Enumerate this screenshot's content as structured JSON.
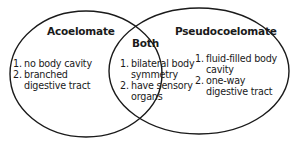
{
  "diagram": {
    "type": "venn",
    "left": {
      "title": "Acoelomate",
      "items": [
        {
          "num": "1.",
          "lines": [
            "no body cavity"
          ]
        },
        {
          "num": "2.",
          "lines": [
            "branched",
            "digestive tract"
          ]
        }
      ]
    },
    "center": {
      "title": "Both",
      "items": [
        {
          "num": "1.",
          "lines": [
            "bilateral body",
            "symmetry"
          ]
        },
        {
          "num": "2.",
          "lines": [
            "have sensory",
            "organs"
          ]
        }
      ]
    },
    "right": {
      "title": "Pseudocoelomate",
      "items": [
        {
          "num": "1.",
          "lines": [
            "fluid-filled body",
            "cavity"
          ]
        },
        {
          "num": "2.",
          "lines": [
            "one-way",
            "digestive tract"
          ]
        }
      ]
    },
    "colors": {
      "stroke": "#1a1a1a",
      "text": "#1a1a1a",
      "background": "#ffffff"
    }
  }
}
